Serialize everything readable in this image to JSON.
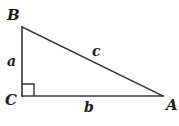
{
  "figure": {
    "kind": "right-triangle-diagram",
    "background_color": "#ffffff",
    "stroke_color": "#333333",
    "label_color": "#1c1c1c",
    "canvas": {
      "width": 179,
      "height": 126
    },
    "vertices": [
      {
        "name": "B",
        "label": "B",
        "x": 22,
        "y": 27
      },
      {
        "name": "C",
        "label": "C",
        "x": 22,
        "y": 96
      },
      {
        "name": "A",
        "label": "A",
        "x": 163,
        "y": 96
      }
    ],
    "sides": [
      {
        "name": "leg-vertical",
        "label": "a",
        "from": "B",
        "to": "C"
      },
      {
        "name": "leg-horizontal",
        "label": "b",
        "from": "C",
        "to": "A"
      },
      {
        "name": "hypotenuse",
        "label": "c",
        "from": "B",
        "to": "A"
      }
    ],
    "right_angle": {
      "at_vertex": "C",
      "marker": "square",
      "x": 22,
      "y": 84,
      "size": 12
    }
  }
}
